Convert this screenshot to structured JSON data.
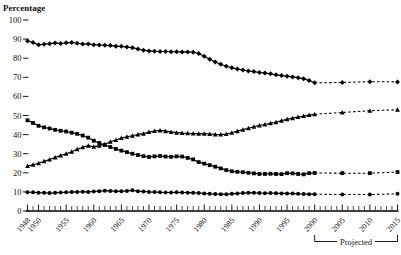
{
  "chart_data": {
    "type": "line",
    "title": "",
    "ylabel": "Percentage",
    "xlabel": "",
    "ylim": [
      0,
      100
    ],
    "xlim": [
      1948,
      2015
    ],
    "yticks": [
      0,
      10,
      20,
      30,
      40,
      50,
      60,
      70,
      80,
      90,
      100
    ],
    "xticks": [
      1948,
      1950,
      1955,
      1960,
      1965,
      1970,
      1975,
      1980,
      1985,
      1990,
      1995,
      2000,
      2005,
      2010,
      2015
    ],
    "xtick_labels": [
      "1948",
      "1950",
      "1955",
      "1960",
      "1965",
      "1970",
      "1975",
      "1980",
      "1985",
      "1990",
      "1995",
      "2000",
      "2005",
      "2010",
      "2015"
    ],
    "grid": false,
    "legend_position": "none",
    "annotations": [
      {
        "text": "Projected",
        "x_start": 2000,
        "x_end": 2015,
        "type": "bracket-below-axis"
      }
    ],
    "projection_starts": 2000,
    "x": [
      1948,
      1949,
      1950,
      1951,
      1952,
      1953,
      1954,
      1955,
      1956,
      1957,
      1958,
      1959,
      1960,
      1961,
      1962,
      1963,
      1964,
      1965,
      1966,
      1967,
      1968,
      1969,
      1970,
      1971,
      1972,
      1973,
      1974,
      1975,
      1976,
      1977,
      1978,
      1979,
      1980,
      1981,
      1982,
      1983,
      1984,
      1985,
      1986,
      1987,
      1988,
      1989,
      1990,
      1991,
      1992,
      1993,
      1994,
      1995,
      1996,
      1997,
      1998,
      1999,
      2000
    ],
    "x_projected": [
      2000,
      2005,
      2010,
      2015
    ],
    "series": [
      {
        "name": "series-diamond",
        "marker": "diamond",
        "values": [
          89.0,
          88.2,
          87.0,
          87.3,
          87.6,
          88.0,
          87.7,
          88.1,
          88.2,
          87.8,
          87.5,
          87.4,
          87.1,
          86.9,
          86.8,
          86.6,
          86.3,
          86.2,
          85.8,
          85.5,
          84.8,
          84.2,
          83.8,
          83.6,
          83.5,
          83.5,
          83.4,
          83.4,
          83.3,
          83.2,
          83.1,
          82.5,
          81.0,
          79.5,
          78.0,
          76.8,
          75.8,
          75.0,
          74.3,
          73.8,
          73.3,
          73.0,
          72.5,
          72.2,
          71.8,
          71.3,
          70.9,
          70.6,
          70.2,
          69.8,
          69.2,
          68.3,
          67.1
        ],
        "values_projected": [
          67.1,
          67.3,
          67.7,
          67.6
        ]
      },
      {
        "name": "series-triangle",
        "marker": "triangle",
        "values": [
          23.5,
          24.2,
          25.0,
          26.0,
          27.0,
          28.0,
          29.0,
          30.0,
          31.0,
          32.3,
          33.4,
          34.2,
          33.6,
          34.2,
          35.0,
          36.3,
          37.2,
          38.2,
          38.9,
          39.4,
          40.1,
          40.5,
          41.3,
          41.9,
          42.2,
          41.8,
          41.4,
          41.0,
          40.8,
          40.7,
          40.6,
          40.5,
          40.5,
          40.3,
          40.1,
          40.0,
          40.3,
          41.0,
          41.8,
          42.6,
          43.3,
          44.1,
          44.8,
          45.3,
          45.9,
          46.5,
          47.3,
          48.0,
          48.6,
          49.2,
          49.7,
          50.2,
          50.6
        ],
        "values_projected": [
          50.6,
          51.6,
          52.5,
          53.0
        ]
      },
      {
        "name": "series-square",
        "marker": "square",
        "values": [
          47.5,
          46.1,
          44.6,
          43.8,
          43.2,
          42.5,
          42.0,
          41.6,
          41.0,
          40.4,
          39.5,
          38.4,
          36.8,
          35.6,
          34.5,
          33.5,
          32.5,
          31.6,
          30.8,
          30.0,
          29.3,
          28.7,
          28.3,
          28.6,
          28.8,
          28.5,
          28.4,
          28.6,
          28.5,
          27.8,
          27.0,
          25.6,
          24.8,
          24.0,
          23.2,
          22.3,
          21.4,
          20.8,
          20.5,
          20.3,
          20.0,
          19.7,
          19.4,
          19.4,
          19.5,
          19.4,
          19.3,
          19.8,
          19.7,
          19.4,
          19.2,
          19.8,
          19.9
        ],
        "values_projected": [
          19.9,
          19.8,
          19.8,
          20.4
        ]
      },
      {
        "name": "series-circle",
        "marker": "circle",
        "values": [
          9.8,
          9.8,
          9.6,
          9.5,
          9.4,
          9.5,
          9.7,
          9.8,
          9.9,
          10.0,
          10.1,
          10.0,
          10.2,
          10.4,
          10.6,
          10.5,
          10.4,
          10.3,
          10.5,
          10.8,
          10.4,
          10.2,
          10.0,
          9.9,
          9.8,
          9.7,
          9.7,
          9.8,
          9.7,
          9.6,
          9.5,
          9.4,
          9.2,
          9.0,
          8.9,
          8.8,
          8.8,
          9.0,
          9.2,
          9.4,
          9.6,
          9.5,
          9.4,
          9.3,
          9.4,
          9.3,
          9.2,
          9.2,
          9.1,
          9.0,
          8.9,
          8.8,
          8.8
        ],
        "values_projected": [
          8.8,
          8.6,
          8.6,
          9.0
        ]
      }
    ]
  },
  "labels": {
    "ytitle": "Percentage",
    "projected": "Projected"
  }
}
